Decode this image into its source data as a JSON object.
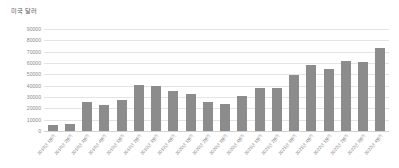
{
  "chart_data": {
    "type": "bar",
    "title": "미국 달러",
    "xlabel": "",
    "ylabel": "미국 달러",
    "ylim": [
      0,
      90000
    ],
    "ytick_step": 10000,
    "grid": true,
    "legend": "none",
    "bar_color": "#8c8c8c",
    "categories": [
      "2018년 1분기",
      "2018년 2분기",
      "2018년 3분기",
      "2018년 4분기",
      "2019년 1분기",
      "2019년 2분기",
      "2019년 3분기",
      "2019년 4분기",
      "2020년 1분기",
      "2020년 2분기",
      "2020년 3분기",
      "2020년 4분기",
      "2021년 1분기",
      "2021년 2분기",
      "2021년 3분기",
      "2021년 4분기",
      "2022년 1분기",
      "2022년 2분기",
      "2022년 3분기",
      "2022년 4분기"
    ],
    "values": [
      5000,
      6000,
      26000,
      23000,
      27000,
      41000,
      40000,
      35000,
      33000,
      26000,
      24000,
      31000,
      38000,
      38000,
      49000,
      58000,
      55000,
      62000,
      61000,
      73000
    ],
    "ytick_labels": [
      "90000",
      "80000",
      "70000",
      "60000",
      "50000",
      "40000",
      "30000",
      "20000",
      "10000",
      "0"
    ],
    "ytick_values": [
      90000,
      80000,
      70000,
      60000,
      50000,
      40000,
      30000,
      20000,
      10000,
      0
    ]
  }
}
